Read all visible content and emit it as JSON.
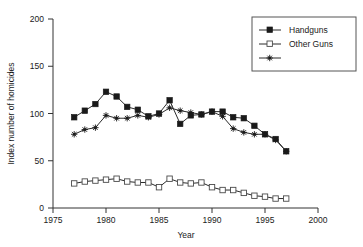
{
  "chart_data": {
    "type": "line",
    "title": "",
    "xlabel": "Year",
    "ylabel": "Index number of homicides",
    "xlim": [
      1975,
      2000
    ],
    "ylim": [
      0,
      200
    ],
    "xticks": [
      "1975",
      "1980",
      "1985",
      "1990",
      "1995",
      "2000"
    ],
    "yticks": [
      "0",
      "50",
      "100",
      "150",
      "200"
    ],
    "grid": false,
    "legend_position": "top-right",
    "x": [
      1977,
      1978,
      1979,
      1980,
      1981,
      1982,
      1983,
      1984,
      1985,
      1986,
      1987,
      1988,
      1989,
      1990,
      1991,
      1992,
      1993,
      1994,
      1995,
      1996,
      1997
    ],
    "series": [
      {
        "name": "Handguns",
        "marker": "filled-square",
        "values": [
          96,
          103,
          110,
          123,
          118,
          107,
          104,
          97,
          100,
          114,
          89,
          98,
          99,
          102,
          102,
          96,
          95,
          87,
          78,
          73,
          60
        ]
      },
      {
        "name": "Other Guns",
        "marker": "open-square",
        "values": [
          26,
          28,
          29,
          30,
          31,
          28,
          27,
          27,
          22,
          31,
          27,
          26,
          27,
          22,
          19,
          19,
          16,
          13,
          12,
          10,
          10
        ]
      },
      {
        "name": "Non-Guns",
        "marker": "star",
        "values": [
          78,
          83,
          85,
          98,
          95,
          95,
          98,
          96,
          99,
          106,
          103,
          101,
          99,
          102,
          97,
          84,
          80,
          78,
          78,
          72,
          60
        ]
      }
    ]
  },
  "legend": {
    "entries": [
      {
        "label": "Handguns"
      },
      {
        "label": "Other Guns"
      },
      {
        "label": "Non-Guns"
      }
    ]
  },
  "axes": {
    "x_title": "Year",
    "y_title": "Index number of homicides"
  }
}
